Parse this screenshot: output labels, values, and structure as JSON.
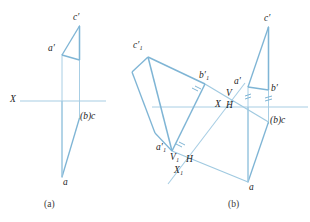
{
  "figure": {
    "title": "",
    "stroke_color": "#7fb5d5",
    "axis_color": "#a8cee4",
    "thin_color": "#9fc9e0",
    "text_color": "#1c1c1c",
    "caption_color": "#3a3a3a",
    "background": "#ffffff"
  },
  "panel_a": {
    "caption": "(a)",
    "axis_label": "X",
    "labels": {
      "c_prime": "c′",
      "a_prime": "a′",
      "bc": "(b)c",
      "a": "a"
    },
    "geometry": {
      "axis_y": 101,
      "axis_x1": 20,
      "axis_x2": 105,
      "v_front": {
        "a_prime": [
          62,
          55
        ],
        "c_prime": [
          79,
          26
        ],
        "b_prime": [
          79,
          60
        ]
      },
      "h_top": {
        "a": [
          62,
          177
        ],
        "c": [
          79,
          117
        ],
        "b": [
          79,
          117
        ]
      },
      "projectors": [
        [
          62,
          55,
          62,
          177
        ],
        [
          79,
          26,
          79,
          117
        ]
      ]
    }
  },
  "panel_b": {
    "caption": "(b)",
    "labels": {
      "c1_prime": "c′₁",
      "b1_prime": "b′₁",
      "a1_prime": "a′₁",
      "c_prime": "c′",
      "a_prime": "a′",
      "b_prime": "b′",
      "bc": "(b)c",
      "a": "a",
      "axis_x": "X",
      "axis_v": "V",
      "axis_h": "H",
      "axis_x1": "X₁",
      "axis_v1": "V₁",
      "axis_h1": "H"
    },
    "geometry": {
      "axis_y": 107,
      "axis_x1": 225,
      "axis_x2": 308,
      "axis_left_x1": 152,
      "aux_axis": [
        [
          170,
          182
        ],
        [
          243,
          85
        ]
      ],
      "v_front": {
        "a_prime": [
          248,
          87
        ],
        "c_prime": [
          268,
          27
        ],
        "b_prime": [
          268,
          90
        ]
      },
      "h_top": {
        "a": [
          248,
          182
        ],
        "c": [
          268,
          122
        ],
        "b": [
          268,
          122
        ]
      },
      "rot_front": {
        "a1_prime": [
          172,
          151
        ],
        "b1_prime": [
          205,
          84
        ],
        "c1_prime": [
          148,
          57
        ]
      },
      "rot_aux": {
        "a1": [
          160,
          144
        ],
        "b1": [
          196,
          92
        ],
        "c1": [
          152,
          52
        ]
      }
    }
  }
}
